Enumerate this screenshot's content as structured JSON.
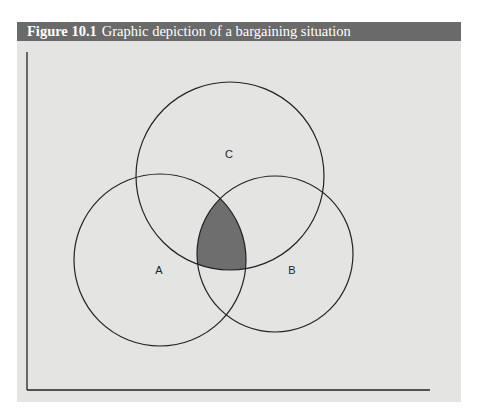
{
  "figure": {
    "number": "Figure 10.1",
    "title": "Graphic depiction of a bargaining situation",
    "colors": {
      "header_bg": "#6a6a6a",
      "header_text": "#ffffff",
      "panel_bg": "#e4e4e3",
      "line": "#222222",
      "overlap_fill": "#6e6e6e"
    }
  },
  "diagram": {
    "circles": [
      {
        "id": "A",
        "label": "A",
        "cx": 160,
        "cy": 260,
        "r": 86,
        "label_x": 159,
        "label_y": 274
      },
      {
        "id": "B",
        "label": "B",
        "cx": 275,
        "cy": 254,
        "r": 78,
        "label_x": 292,
        "label_y": 274
      },
      {
        "id": "C",
        "label": "C",
        "cx": 230,
        "cy": 176,
        "r": 94,
        "label_x": 229,
        "label_y": 158
      }
    ],
    "shaded_region": "A∩B∩C",
    "axes": {
      "origin_x": 27,
      "origin_y": 390,
      "y_top": 52,
      "x_right": 430
    }
  }
}
